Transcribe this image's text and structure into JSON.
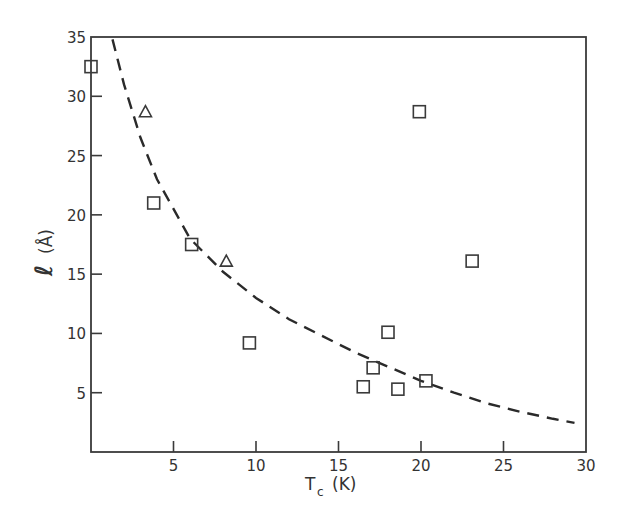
{
  "chart_data": {
    "type": "scatter",
    "title": "",
    "xlabel": "T_c (K)",
    "xlabel_main": "T",
    "xlabel_sub": "c",
    "xlabel_unit": "(K)",
    "ylabel": "ℓ (Å)",
    "ylabel_symbol": "ℓ",
    "ylabel_unit": "(Å)",
    "xlim": [
      0,
      30
    ],
    "ylim": [
      0,
      35
    ],
    "x_ticks": [
      5,
      10,
      15,
      20,
      25,
      30
    ],
    "y_ticks": [
      5,
      10,
      15,
      20,
      25,
      30,
      35
    ],
    "grid": false,
    "legend": "none",
    "series": [
      {
        "name": "squares",
        "marker": "square",
        "points": [
          {
            "x": 0.0,
            "y": 32.5
          },
          {
            "x": 3.8,
            "y": 21.0
          },
          {
            "x": 6.1,
            "y": 17.5
          },
          {
            "x": 9.6,
            "y": 9.2
          },
          {
            "x": 16.5,
            "y": 5.5
          },
          {
            "x": 17.1,
            "y": 7.1
          },
          {
            "x": 18.0,
            "y": 10.1
          },
          {
            "x": 18.6,
            "y": 5.3
          },
          {
            "x": 19.9,
            "y": 28.7
          },
          {
            "x": 20.3,
            "y": 6.0
          },
          {
            "x": 23.1,
            "y": 16.1
          }
        ]
      },
      {
        "name": "triangles",
        "marker": "triangle",
        "points": [
          {
            "x": 3.3,
            "y": 28.7
          },
          {
            "x": 8.2,
            "y": 16.1
          }
        ]
      },
      {
        "name": "fit",
        "style": "dashed-line",
        "points": [
          {
            "x": 1.3,
            "y": 34.8
          },
          {
            "x": 2,
            "y": 31.0
          },
          {
            "x": 3,
            "y": 26.5
          },
          {
            "x": 4,
            "y": 23.0
          },
          {
            "x": 5,
            "y": 20.5
          },
          {
            "x": 6,
            "y": 18.0
          },
          {
            "x": 8,
            "y": 15.2
          },
          {
            "x": 10,
            "y": 13.0
          },
          {
            "x": 12,
            "y": 11.2
          },
          {
            "x": 14,
            "y": 9.8
          },
          {
            "x": 16,
            "y": 8.4
          },
          {
            "x": 18,
            "y": 7.2
          },
          {
            "x": 20,
            "y": 6.0
          },
          {
            "x": 22,
            "y": 5.0
          },
          {
            "x": 24,
            "y": 4.1
          },
          {
            "x": 26,
            "y": 3.4
          },
          {
            "x": 28,
            "y": 2.8
          },
          {
            "x": 29.3,
            "y": 2.45
          }
        ]
      }
    ]
  }
}
